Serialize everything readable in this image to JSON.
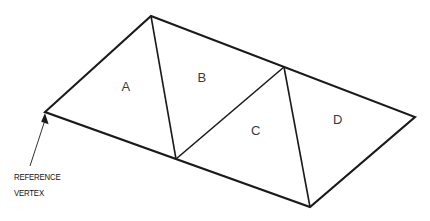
{
  "diagram": {
    "background_color": "#ffffff",
    "line_color": "#1a1a1a",
    "label_color": "#3a3a3a",
    "text_color": "#111111",
    "faces": [
      {
        "id": "A",
        "label": "A",
        "x": 126,
        "y": 88
      },
      {
        "id": "B",
        "label": "B",
        "x": 202,
        "y": 79
      },
      {
        "id": "C",
        "label": "C",
        "x": 256,
        "y": 132
      },
      {
        "id": "D",
        "label": "D",
        "x": 338,
        "y": 121
      }
    ],
    "vertices": {
      "top_apex": {
        "x": 151,
        "y": 16
      },
      "left": {
        "x": 45,
        "y": 112
      },
      "bottom_mid": {
        "x": 176,
        "y": 159
      },
      "bottom_right": {
        "x": 310,
        "y": 207
      },
      "right": {
        "x": 415,
        "y": 117
      },
      "top_mid_right": {
        "x": 284,
        "y": 67
      }
    },
    "outline_points": "151,16 415,117 310,207 45,112",
    "inner_edges": [
      {
        "name": "edge-apex-to-bottom-mid",
        "d": "M151,16 L176,159"
      },
      {
        "name": "edge-bottom-mid-to-top-mid-right",
        "d": "M176,159 L284,67"
      },
      {
        "name": "edge-top-mid-right-to-bottom-right",
        "d": "M284,67 L310,207"
      }
    ],
    "callout": {
      "line1": "REFERENCE",
      "line2": "VERTEX",
      "line1_x": 14,
      "line1_y": 180,
      "line2_x": 14,
      "line2_y": 196,
      "leader_d": "M30,166 L45.2,119.5",
      "arrow_points": "45,113 48.6,124.2 41.2,121.8"
    }
  }
}
